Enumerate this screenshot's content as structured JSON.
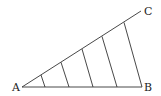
{
  "diagram": {
    "labels": {
      "A": "A",
      "B": "B",
      "C": "C"
    },
    "points": {
      "A": [
        22,
        87
      ],
      "B": [
        142,
        87
      ],
      "C": [
        141,
        11
      ]
    },
    "transversals": [
      {
        "base": [
          45,
          87
        ],
        "top": [
          41,
          75
        ]
      },
      {
        "base": [
          69,
          87
        ],
        "top": [
          61,
          62.3
        ]
      },
      {
        "base": [
          93,
          87
        ],
        "top": [
          82,
          49
        ]
      },
      {
        "base": [
          117,
          87
        ],
        "top": [
          102,
          36.4
        ]
      },
      {
        "base": [
          142,
          87
        ],
        "top": [
          124,
          22.4
        ]
      }
    ],
    "colors": {
      "line": "#333333",
      "text": "#222222",
      "background": "#ffffff"
    }
  }
}
